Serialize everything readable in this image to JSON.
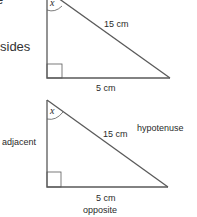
{
  "left_text": {
    "clipped_top": "e",
    "sides": "sides"
  },
  "triangle_top": {
    "angle_label": "x",
    "hypotenuse_length": "15 cm",
    "base_length": "5 cm",
    "line_color": "#555555"
  },
  "triangle_bottom": {
    "angle_label": "x",
    "hypotenuse_length": "15 cm",
    "hypotenuse_name": "hypotenuse",
    "adjacent_name": "adjacent",
    "base_length": "5 cm",
    "opposite_name": "opposite",
    "line_color": "#555555"
  }
}
